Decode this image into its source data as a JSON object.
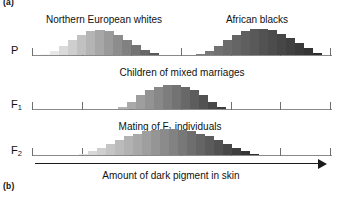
{
  "figure": {
    "panel_a_label": "(a)",
    "panel_b_label": "(b)",
    "axis_title": "Amount of dark pigment in skin",
    "arrow_icon": "right-arrow-icon"
  },
  "rows": [
    {
      "id": "P",
      "label": "P",
      "label_sub": "",
      "tick_count": 7,
      "captions": [
        {
          "text": "Northern European whites",
          "center_pct": 24.0
        },
        {
          "text": "African blacks",
          "center_pct": 75.0
        }
      ]
    },
    {
      "id": "F1",
      "label": "F",
      "label_sub": "1",
      "tick_count": 7,
      "captions": [
        {
          "text": "Children of mixed marriages",
          "center_pct": 50.0
        }
      ]
    },
    {
      "id": "F2",
      "label": "F",
      "label_sub": "2",
      "tick_count": 7,
      "captions": [
        {
          "text": "Mating of F₁ individuals",
          "center_pct": 46.0
        }
      ]
    }
  ],
  "colors": {
    "axis": "#8a8a8a",
    "tick": "#6f6f6f",
    "text": "#111111",
    "arrow": "#1a1a1a",
    "pigment_light": "#f2f2f2",
    "pigment_dark": "#3a3a3a"
  },
  "chart_data": {
    "type": "bar",
    "xlabel": "Amount of dark pigment in skin",
    "ylabel": "Frequency of individuals",
    "grid": false,
    "legend": "none",
    "xlim": [
      0,
      100
    ],
    "ylim": [
      0,
      26
    ],
    "note": "x positions are percent of the shared horizontal axis; heights are relative frequencies in pixels",
    "distributions": [
      {
        "row": "P",
        "name": "Northern European whites",
        "x": [
          4.5,
          7.5,
          10.5,
          13.5,
          16.5,
          19.5,
          22.5,
          25.5,
          28.5,
          31.5,
          34.5,
          37.5,
          40.5
        ],
        "values": [
          1,
          3,
          7,
          12,
          16,
          19,
          20,
          19,
          16,
          12,
          8,
          4,
          2
        ],
        "shade_from": "#f4f4f4",
        "shade_to": "#5a5a5a"
      },
      {
        "row": "P",
        "name": "African blacks",
        "x": [
          56.0,
          59.0,
          62.0,
          65.0,
          68.0,
          71.0,
          74.0,
          77.0,
          80.0,
          83.0,
          86.0,
          89.0,
          92.0,
          95.0
        ],
        "values": [
          1,
          3,
          7,
          12,
          16,
          19,
          21,
          21,
          20,
          17,
          14,
          10,
          6,
          2
        ],
        "shade_from": "#7d7d7d",
        "shade_to": "#2e2e2e"
      },
      {
        "row": "F1",
        "name": "Children of mixed marriages",
        "x": [
          30.0,
          33.0,
          36.0,
          39.0,
          42.0,
          45.0,
          48.0,
          51.0,
          54.0,
          57.0,
          60.0,
          63.0
        ],
        "values": [
          2,
          6,
          11,
          15,
          18,
          19,
          19,
          18,
          15,
          11,
          6,
          2
        ],
        "shade_from": "#b4b4b4",
        "shade_to": "#3c3c3c"
      },
      {
        "row": "F2",
        "name": "Mating of F₁ individuals",
        "x": [
          17.0,
          20.0,
          23.0,
          26.0,
          29.0,
          32.0,
          35.0,
          38.0,
          41.0,
          44.0,
          47.0,
          50.0,
          53.0,
          56.0,
          59.0,
          62.0,
          65.0,
          68.0,
          71.0,
          74.0
        ],
        "values": [
          1,
          3,
          6,
          9,
          12,
          15,
          17,
          19,
          20,
          21,
          21,
          20,
          19,
          17,
          15,
          12,
          9,
          6,
          3,
          1
        ],
        "shade_from": "#e2e2e2",
        "shade_to": "#2b2b2b"
      }
    ]
  }
}
